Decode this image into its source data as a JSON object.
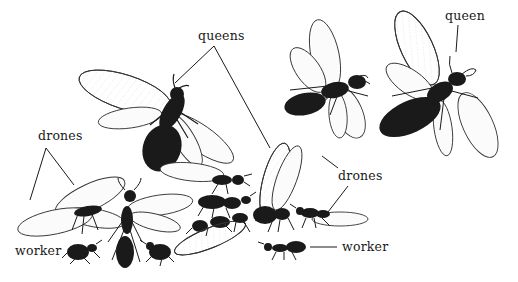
{
  "figure": {
    "colors": {
      "ink": "#1a1a1a",
      "wing_line": "#333333",
      "wing_fill": "#fbfbfb",
      "background": "#ffffff"
    },
    "labels": [
      {
        "id": "queens",
        "text": "queens",
        "x": 198,
        "y": 30
      },
      {
        "id": "queen",
        "text": "queen",
        "x": 445,
        "y": 10
      },
      {
        "id": "drones-left",
        "text": "drones",
        "x": 38,
        "y": 130
      },
      {
        "id": "drones-right",
        "text": "drones",
        "x": 338,
        "y": 170
      },
      {
        "id": "worker-left",
        "text": "worker",
        "x": 15,
        "y": 245
      },
      {
        "id": "worker-right",
        "text": "worker",
        "x": 342,
        "y": 241
      }
    ]
  }
}
